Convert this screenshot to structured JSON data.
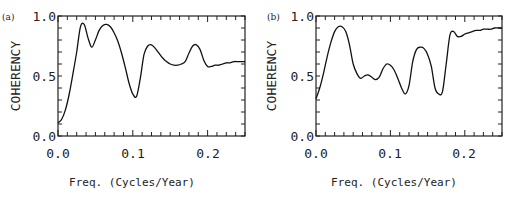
{
  "chart_data": [
    {
      "panel": "(a)",
      "type": "line",
      "xlabel": "Freq. (Cycles/Year)",
      "ylabel": "COHERENCY",
      "xlim": [
        0,
        0.25
      ],
      "ylim": [
        0,
        1.0
      ],
      "xticks": [
        "0.0",
        "0.1",
        "0.2"
      ],
      "yticks": [
        "0.0",
        "0.5",
        "1.0"
      ],
      "x": [
        0.0,
        0.005,
        0.01,
        0.015,
        0.02,
        0.025,
        0.03,
        0.035,
        0.04,
        0.045,
        0.05,
        0.055,
        0.06,
        0.065,
        0.07,
        0.075,
        0.08,
        0.085,
        0.09,
        0.095,
        0.1,
        0.105,
        0.11,
        0.115,
        0.12,
        0.125,
        0.13,
        0.135,
        0.14,
        0.145,
        0.15,
        0.155,
        0.16,
        0.165,
        0.17,
        0.175,
        0.18,
        0.185,
        0.19,
        0.195,
        0.2,
        0.205,
        0.21,
        0.215,
        0.22,
        0.225,
        0.23,
        0.235,
        0.24,
        0.245,
        0.25
      ],
      "values": [
        0.11,
        0.14,
        0.22,
        0.35,
        0.52,
        0.7,
        0.91,
        0.93,
        0.82,
        0.74,
        0.8,
        0.88,
        0.92,
        0.93,
        0.91,
        0.86,
        0.79,
        0.69,
        0.57,
        0.44,
        0.35,
        0.33,
        0.48,
        0.68,
        0.75,
        0.76,
        0.73,
        0.69,
        0.65,
        0.62,
        0.6,
        0.59,
        0.59,
        0.6,
        0.62,
        0.69,
        0.75,
        0.76,
        0.72,
        0.63,
        0.58,
        0.58,
        0.59,
        0.59,
        0.6,
        0.61,
        0.61,
        0.62,
        0.62,
        0.62,
        0.62
      ]
    },
    {
      "panel": "(b)",
      "type": "line",
      "xlabel": "Freq. (Cycles/Year)",
      "ylabel": "COHERENCY",
      "xlim": [
        0,
        0.25
      ],
      "ylim": [
        0,
        1.0
      ],
      "xticks": [
        "0.0",
        "0.1",
        "0.2"
      ],
      "yticks": [
        "0.0",
        "0.5",
        "1.0"
      ],
      "x": [
        0.0,
        0.005,
        0.01,
        0.015,
        0.02,
        0.025,
        0.03,
        0.035,
        0.04,
        0.045,
        0.05,
        0.055,
        0.06,
        0.065,
        0.07,
        0.075,
        0.08,
        0.085,
        0.09,
        0.095,
        0.1,
        0.105,
        0.11,
        0.115,
        0.12,
        0.125,
        0.13,
        0.135,
        0.14,
        0.145,
        0.15,
        0.155,
        0.16,
        0.165,
        0.17,
        0.175,
        0.18,
        0.185,
        0.19,
        0.195,
        0.2,
        0.205,
        0.21,
        0.215,
        0.22,
        0.225,
        0.23,
        0.235,
        0.24,
        0.245,
        0.25
      ],
      "values": [
        0.31,
        0.4,
        0.52,
        0.66,
        0.78,
        0.87,
        0.91,
        0.91,
        0.87,
        0.76,
        0.6,
        0.52,
        0.48,
        0.5,
        0.51,
        0.49,
        0.47,
        0.49,
        0.56,
        0.6,
        0.59,
        0.55,
        0.48,
        0.4,
        0.35,
        0.42,
        0.62,
        0.72,
        0.74,
        0.73,
        0.68,
        0.58,
        0.4,
        0.35,
        0.37,
        0.6,
        0.84,
        0.87,
        0.83,
        0.83,
        0.85,
        0.86,
        0.87,
        0.88,
        0.88,
        0.89,
        0.89,
        0.89,
        0.9,
        0.9,
        0.9
      ]
    }
  ],
  "panels": [
    {
      "label": "(a)",
      "ylabel": "COHERENCY",
      "xlabel": "Freq. (Cycles/Year)",
      "yticks": [
        "0.0",
        "0.5",
        "1.0"
      ],
      "xticks": [
        "0.0",
        "0.1",
        "0.2"
      ]
    },
    {
      "label": "(b)",
      "ylabel": "COHERENCY",
      "xlabel": "Freq. (Cycles/Year)",
      "yticks": [
        "0.0",
        "0.5",
        "1.0"
      ],
      "xticks": [
        "0.0",
        "0.1",
        "0.2"
      ]
    }
  ]
}
